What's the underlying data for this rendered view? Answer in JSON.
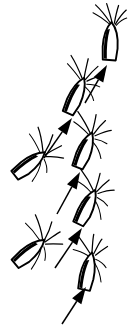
{
  "figure": {
    "title": "Seed diaspore self-righting sequence",
    "background_color": "#ffffff",
    "ink_color": "#000000",
    "width": 128,
    "height": 332,
    "style": "ink line drawing"
  },
  "seeds": [
    {
      "id": "seed-1",
      "label": "Diaspore 1",
      "stage": "upright",
      "order": 6,
      "tilt_degrees": 4,
      "center_x": 110,
      "center_y": 42,
      "awn_count": 5
    },
    {
      "id": "seed-2",
      "label": "Diaspore 2",
      "stage": "near-upright",
      "order": 5,
      "tilt_degrees": 24,
      "center_x": 76,
      "center_y": 96,
      "awn_count": 5
    },
    {
      "id": "seed-3",
      "label": "Diaspore 3",
      "stage": "tilting",
      "order": 4,
      "tilt_degrees": 22,
      "center_x": 85,
      "center_y": 150,
      "awn_count": 5
    },
    {
      "id": "seed-4",
      "label": "Diaspore 4",
      "stage": "oblique",
      "order": 3,
      "tilt_degrees": 26,
      "center_x": 87,
      "center_y": 207,
      "awn_count": 5
    },
    {
      "id": "seed-5",
      "label": "Diaspore 5",
      "stage": "rising",
      "order": 2,
      "tilt_degrees": 12,
      "center_x": 88,
      "center_y": 271,
      "awn_count": 5
    },
    {
      "id": "seed-6",
      "label": "Diaspore 6",
      "stage": "resting-oblique",
      "order": 1,
      "tilt_degrees": 52,
      "center_x": 30,
      "center_y": 164,
      "awn_count": 5
    },
    {
      "id": "seed-7",
      "label": "Diaspore 7",
      "stage": "resting-oblique",
      "order": 0,
      "tilt_degrees": 50,
      "center_x": 30,
      "center_y": 252,
      "awn_count": 5
    }
  ],
  "arrows": [
    {
      "id": "arrow-1",
      "label": "Transition arrow 1",
      "direction": "up-right",
      "from_x": 85,
      "from_y": 103,
      "to_x": 107,
      "to_y": 65
    },
    {
      "id": "arrow-2",
      "label": "Transition arrow 2",
      "direction": "up-right",
      "from_x": 44,
      "from_y": 158,
      "to_x": 72,
      "to_y": 118
    },
    {
      "id": "arrow-3",
      "label": "Transition arrow 3",
      "direction": "up-right",
      "from_x": 57,
      "from_y": 214,
      "to_x": 80,
      "to_y": 172
    },
    {
      "id": "arrow-4",
      "label": "Transition arrow 4",
      "direction": "up-right",
      "from_x": 55,
      "from_y": 268,
      "to_x": 82,
      "to_y": 228
    },
    {
      "id": "arrow-5",
      "label": "Transition arrow 5",
      "direction": "up-right",
      "from_x": 62,
      "from_y": 324,
      "to_x": 86,
      "to_y": 287
    }
  ]
}
